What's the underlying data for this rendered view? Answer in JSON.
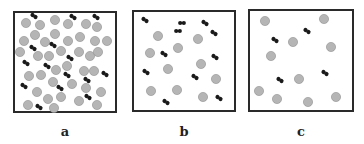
{
  "figure": {
    "panels": [
      {
        "label": "a",
        "box": {
          "x": 13,
          "y": 11,
          "w": 104,
          "h": 102
        },
        "atoms": [
          [
            26,
            23
          ],
          [
            40,
            25
          ],
          [
            55,
            20
          ],
          [
            68,
            24
          ],
          [
            86,
            24
          ],
          [
            97,
            27
          ],
          [
            24,
            41
          ],
          [
            35,
            35
          ],
          [
            45,
            42
          ],
          [
            55,
            34
          ],
          [
            68,
            41
          ],
          [
            80,
            37
          ],
          [
            95,
            41
          ],
          [
            107,
            41
          ],
          [
            20,
            52
          ],
          [
            38,
            56
          ],
          [
            49,
            56
          ],
          [
            61,
            51
          ],
          [
            79,
            52
          ],
          [
            90,
            56
          ],
          [
            98,
            52
          ],
          [
            29,
            76
          ],
          [
            41,
            75
          ],
          [
            56,
            70
          ],
          [
            67,
            66
          ],
          [
            84,
            71
          ],
          [
            94,
            71
          ],
          [
            53,
            82
          ],
          [
            72,
            84
          ],
          [
            86,
            88
          ],
          [
            101,
            92
          ],
          [
            37,
            92
          ],
          [
            48,
            99
          ],
          [
            61,
            97
          ],
          [
            79,
            101
          ],
          [
            28,
            105
          ],
          [
            54,
            108
          ],
          [
            97,
            105
          ]
        ],
        "molecules": [
          [
            34,
            16,
            35
          ],
          [
            73,
            17,
            35
          ],
          [
            96,
            17,
            35
          ],
          [
            33,
            48,
            35
          ],
          [
            53,
            45,
            35
          ],
          [
            70,
            58,
            35
          ],
          [
            26,
            63,
            35
          ],
          [
            47,
            66,
            35
          ],
          [
            67,
            75,
            35
          ],
          [
            105,
            74,
            35
          ],
          [
            24,
            86,
            35
          ],
          [
            60,
            88,
            35
          ],
          [
            87,
            80,
            35
          ],
          [
            88,
            97,
            35
          ],
          [
            39,
            107,
            35
          ]
        ]
      },
      {
        "label": "b",
        "box": {
          "x": 132,
          "y": 10,
          "w": 104,
          "h": 102
        },
        "atoms": [
          [
            158,
            36
          ],
          [
            198,
            39
          ],
          [
            150,
            53
          ],
          [
            178,
            48
          ],
          [
            168,
            69
          ],
          [
            201,
            64
          ],
          [
            216,
            79
          ],
          [
            151,
            91
          ],
          [
            177,
            90
          ],
          [
            203,
            97
          ]
        ],
        "molecules": [
          [
            145,
            20,
            35
          ],
          [
            182,
            23,
            0
          ],
          [
            178,
            31,
            0
          ],
          [
            205,
            23,
            35
          ],
          [
            214,
            33,
            35
          ],
          [
            164,
            54,
            35
          ],
          [
            215,
            57,
            35
          ],
          [
            146,
            72,
            35
          ],
          [
            195,
            77,
            35
          ],
          [
            166,
            102,
            35
          ],
          [
            219,
            98,
            35
          ]
        ]
      },
      {
        "label": "c",
        "box": {
          "x": 248,
          "y": 9,
          "w": 106,
          "h": 103
        },
        "atoms": [
          [
            265,
            21
          ],
          [
            324,
            19
          ],
          [
            293,
            42
          ],
          [
            331,
            47
          ],
          [
            271,
            56
          ],
          [
            299,
            79
          ],
          [
            259,
            91
          ],
          [
            277,
            99
          ],
          [
            308,
            102
          ],
          [
            336,
            97
          ]
        ],
        "molecules": [
          [
            307,
            31,
            35
          ],
          [
            275,
            40,
            35
          ],
          [
            280,
            80,
            35
          ],
          [
            325,
            73,
            35
          ]
        ]
      }
    ],
    "colors": {
      "atom_fill": "#b5b5b5",
      "atom_stroke": "#8f8f8f",
      "molecule": "#1a1a1a",
      "box_border": "#2a2a2a"
    },
    "labels_y": 124
  }
}
